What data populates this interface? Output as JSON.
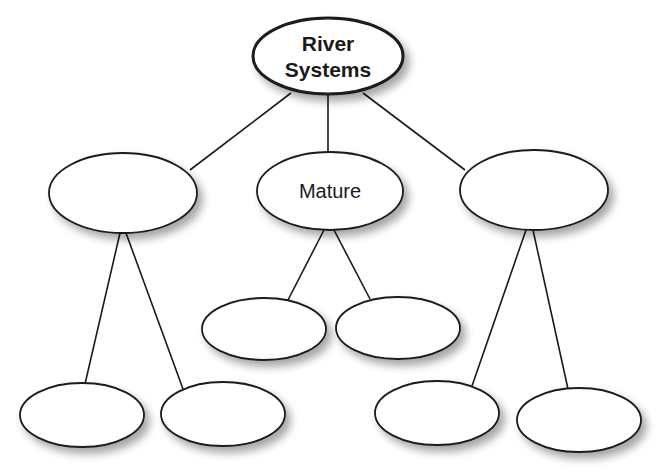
{
  "diagram": {
    "colors": {
      "stroke": "#1a1a1a",
      "fill": "#ffffff",
      "shadow": "#b0b0b0"
    },
    "nodes": [
      {
        "id": "root",
        "label_lines": [
          "River",
          "Systems"
        ],
        "cx": 328,
        "cy": 56,
        "rx": 75,
        "ry": 38,
        "bold": true,
        "stroke_width": 3
      },
      {
        "id": "left",
        "label_lines": [],
        "cx": 123,
        "cy": 193,
        "rx": 74,
        "ry": 40
      },
      {
        "id": "mature",
        "label_lines": [
          "Mature"
        ],
        "cx": 330,
        "cy": 191,
        "rx": 73,
        "ry": 39
      },
      {
        "id": "right",
        "label_lines": [],
        "cx": 534,
        "cy": 190,
        "rx": 74,
        "ry": 40
      },
      {
        "id": "left-child-1",
        "label_lines": [],
        "cx": 82,
        "cy": 415,
        "rx": 62,
        "ry": 32
      },
      {
        "id": "left-child-2",
        "label_lines": [],
        "cx": 223,
        "cy": 414,
        "rx": 62,
        "ry": 32
      },
      {
        "id": "mature-child-1",
        "label_lines": [],
        "cx": 264,
        "cy": 329,
        "rx": 62,
        "ry": 31
      },
      {
        "id": "mature-child-2",
        "label_lines": [],
        "cx": 398,
        "cy": 328,
        "rx": 62,
        "ry": 31
      },
      {
        "id": "right-child-1",
        "label_lines": [],
        "cx": 437,
        "cy": 413,
        "rx": 62,
        "ry": 32
      },
      {
        "id": "right-child-2",
        "label_lines": [],
        "cx": 579,
        "cy": 420,
        "rx": 62,
        "ry": 32
      }
    ],
    "edges": [
      {
        "from": "root",
        "to": "left",
        "x1": 291,
        "y1": 93,
        "x2": 190,
        "y2": 170
      },
      {
        "from": "root",
        "to": "mature",
        "x1": 328,
        "y1": 94,
        "x2": 328,
        "y2": 152
      },
      {
        "from": "root",
        "to": "right",
        "x1": 363,
        "y1": 93,
        "x2": 465,
        "y2": 170
      },
      {
        "from": "left",
        "to": "left-child-1",
        "x1": 120,
        "y1": 233,
        "x2": 85,
        "y2": 384
      },
      {
        "from": "left",
        "to": "left-child-2",
        "x1": 126,
        "y1": 233,
        "x2": 183,
        "y2": 389
      },
      {
        "from": "mature",
        "to": "mature-child-1",
        "x1": 324,
        "y1": 230,
        "x2": 288,
        "y2": 300
      },
      {
        "from": "mature",
        "to": "mature-child-2",
        "x1": 334,
        "y1": 230,
        "x2": 370,
        "y2": 299
      },
      {
        "from": "right",
        "to": "right-child-1",
        "x1": 526,
        "y1": 230,
        "x2": 472,
        "y2": 386
      },
      {
        "from": "right",
        "to": "right-child-2",
        "x1": 533,
        "y1": 230,
        "x2": 568,
        "y2": 389
      }
    ]
  }
}
